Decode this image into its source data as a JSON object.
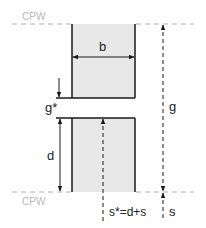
{
  "diagram": {
    "reference_planes": {
      "top_label": "CPW",
      "bottom_label": "CPW"
    },
    "dimensions": {
      "width_label": "b",
      "gap_star_label": "g*",
      "depth_label": "d",
      "gap_label": "g",
      "spacing_label": "s",
      "spacing_star_label": "s*=d+s"
    },
    "colors": {
      "block_fill": "#e8e8e8",
      "block_edge": "#1a1a1a",
      "reference_line": "#b0b0b0",
      "dimension_line": "#1a1a1a",
      "cpw_text": "#b8b8b8"
    }
  }
}
